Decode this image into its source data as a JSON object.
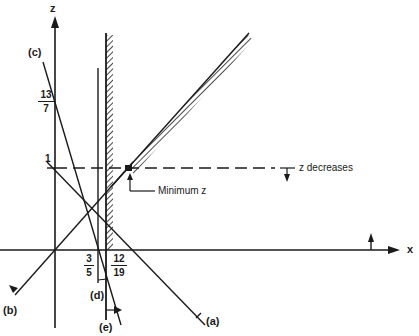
{
  "diagram": {
    "axes": {
      "vertical_label": "z",
      "horizontal_label": "x"
    },
    "tick_labels": {
      "z_one": "1",
      "z_13_7": {
        "num": "13",
        "den": "7"
      },
      "x_3_5": {
        "num": "3",
        "den": "5"
      },
      "x_12_19": {
        "num": "12",
        "den": "19"
      }
    },
    "constraint_labels": {
      "a": "(a)",
      "b": "(b)",
      "c": "(c)",
      "d": "(d)",
      "e": "(e)"
    },
    "annotations": {
      "objective_direction": "z decreases",
      "optimum": "Minimum z"
    },
    "colors": {
      "ink": "#1a1a1a",
      "background": "#ffffff"
    }
  }
}
